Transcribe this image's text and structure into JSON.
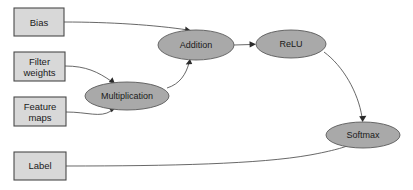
{
  "diagram": {
    "type": "flowchart",
    "colors": {
      "background": "#ffffff",
      "box_fill": "#d8d8d8",
      "box_stroke": "#4a4a4a",
      "ellipse_fill": "#a9a9a9",
      "ellipse_stroke": "#5a5a5a",
      "edge_stroke": "#4d4d4d",
      "text": "#1a1a1a"
    },
    "input_nodes": [
      {
        "id": "bias",
        "label": "Bias",
        "shape": "rectangle",
        "x": 14,
        "y": 8,
        "w": 50,
        "h": 28
      },
      {
        "id": "filter_weights",
        "label_line1": "Filter",
        "label_line2": "weights",
        "shape": "rectangle",
        "x": 14,
        "y": 52,
        "w": 51,
        "h": 29
      },
      {
        "id": "feature_maps",
        "label_line1": "Feature",
        "label_line2": "maps",
        "shape": "rectangle",
        "x": 14,
        "y": 97,
        "w": 52,
        "h": 29
      },
      {
        "id": "label",
        "label": "Label",
        "shape": "rectangle",
        "x": 14,
        "y": 152,
        "w": 52,
        "h": 28
      }
    ],
    "operation_nodes": [
      {
        "id": "multiplication",
        "label": "Multiplication",
        "shape": "ellipse",
        "cx": 127,
        "cy": 96,
        "rx": 42,
        "ry": 14
      },
      {
        "id": "addition",
        "label": "Addition",
        "shape": "ellipse",
        "cx": 196,
        "cy": 45,
        "rx": 38,
        "ry": 15
      },
      {
        "id": "relu",
        "label": "ReLU",
        "shape": "ellipse",
        "cx": 291,
        "cy": 44,
        "rx": 35,
        "ry": 14
      },
      {
        "id": "softmax",
        "label": "Softmax",
        "shape": "ellipse",
        "cx": 363,
        "cy": 135,
        "rx": 37,
        "ry": 13
      }
    ],
    "edges": [
      {
        "id": "bias-to-addition",
        "from": "bias",
        "to": "addition",
        "arrow": true
      },
      {
        "id": "filter-weights-to-multiplication",
        "from": "filter_weights",
        "to": "multiplication",
        "arrow": true
      },
      {
        "id": "feature-maps-to-multiplication",
        "from": "feature_maps",
        "to": "multiplication",
        "arrow": true
      },
      {
        "id": "multiplication-to-addition",
        "from": "multiplication",
        "to": "addition",
        "arrow": true
      },
      {
        "id": "addition-to-relu",
        "from": "addition",
        "to": "relu",
        "arrow": true
      },
      {
        "id": "relu-to-softmax",
        "from": "relu",
        "to": "softmax",
        "arrow": true
      },
      {
        "id": "label-to-softmax",
        "from": "label",
        "to": "softmax",
        "arrow": true
      }
    ]
  }
}
